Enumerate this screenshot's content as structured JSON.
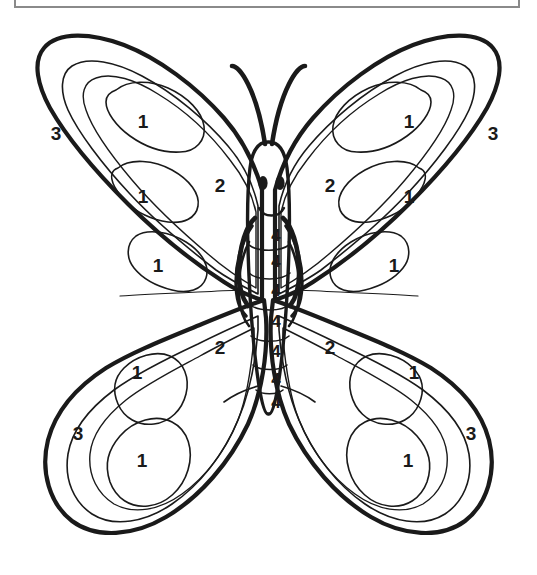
{
  "page": {
    "title_box_text": "",
    "background_color": "#ffffff",
    "ink_color": "#1a1a1a",
    "border_color": "#8a8a8a",
    "width": 537,
    "height": 575
  },
  "artwork": {
    "name": "butterfly-color-by-number",
    "description": "Color-by-number butterfly outline drawing",
    "parts": [
      "left-upper-wing",
      "right-upper-wing",
      "left-lower-wing",
      "right-lower-wing",
      "body",
      "head",
      "antennae",
      "legs"
    ]
  },
  "face": {
    "left_eye": "eye",
    "right_eye": "eye",
    "mouth": "smile"
  },
  "labels": [
    {
      "id": "lw-top-1",
      "value": "1",
      "x": 143,
      "y": 121,
      "region": "left-upper-wing-spot-1"
    },
    {
      "id": "lw-mid-1",
      "value": "1",
      "x": 143,
      "y": 196,
      "region": "left-upper-wing-spot-2"
    },
    {
      "id": "lw-bot-1",
      "value": "1",
      "x": 158,
      "y": 265,
      "region": "left-upper-wing-spot-3"
    },
    {
      "id": "rw-top-1",
      "value": "1",
      "x": 409,
      "y": 121,
      "region": "right-upper-wing-spot-1"
    },
    {
      "id": "rw-mid-1",
      "value": "1",
      "x": 409,
      "y": 196,
      "region": "right-upper-wing-spot-2"
    },
    {
      "id": "rw-bot-1",
      "value": "1",
      "x": 394,
      "y": 265,
      "region": "right-upper-wing-spot-3"
    },
    {
      "id": "llw-top-1",
      "value": "1",
      "x": 137,
      "y": 372,
      "region": "left-lower-wing-spot-1"
    },
    {
      "id": "llw-bot-1",
      "value": "1",
      "x": 142,
      "y": 460,
      "region": "left-lower-wing-spot-2"
    },
    {
      "id": "rlw-top-1",
      "value": "1",
      "x": 414,
      "y": 372,
      "region": "right-lower-wing-spot-1"
    },
    {
      "id": "rlw-bot-1",
      "value": "1",
      "x": 408,
      "y": 460,
      "region": "right-lower-wing-spot-2"
    },
    {
      "id": "lw-inner-2",
      "value": "2",
      "x": 220,
      "y": 185,
      "region": "left-upper-wing-inner"
    },
    {
      "id": "rw-inner-2",
      "value": "2",
      "x": 330,
      "y": 185,
      "region": "right-upper-wing-inner"
    },
    {
      "id": "llw-inner-2",
      "value": "2",
      "x": 220,
      "y": 347,
      "region": "left-lower-wing-inner"
    },
    {
      "id": "rlw-inner-2",
      "value": "2",
      "x": 330,
      "y": 347,
      "region": "right-lower-wing-inner"
    },
    {
      "id": "lw-edge-3",
      "value": "3",
      "x": 56,
      "y": 133,
      "region": "left-upper-wing-border"
    },
    {
      "id": "rw-edge-3",
      "value": "3",
      "x": 493,
      "y": 133,
      "region": "right-upper-wing-border"
    },
    {
      "id": "llw-edge-3",
      "value": "3",
      "x": 78,
      "y": 433,
      "region": "left-lower-wing-border"
    },
    {
      "id": "rlw-edge-3",
      "value": "3",
      "x": 471,
      "y": 433,
      "region": "right-lower-wing-border"
    },
    {
      "id": "body-seg-1",
      "value": "4",
      "x": 276,
      "y": 235,
      "region": "body-segment-1"
    },
    {
      "id": "body-seg-2",
      "value": "4",
      "x": 276,
      "y": 261,
      "region": "body-segment-2"
    },
    {
      "id": "body-seg-3",
      "value": "4",
      "x": 276,
      "y": 290,
      "region": "body-segment-3"
    },
    {
      "id": "body-seg-4",
      "value": "4",
      "x": 276,
      "y": 321,
      "region": "body-segment-4"
    },
    {
      "id": "body-seg-5",
      "value": "4",
      "x": 276,
      "y": 351,
      "region": "body-segment-5"
    },
    {
      "id": "body-seg-6",
      "value": "4",
      "x": 276,
      "y": 379,
      "region": "body-segment-6"
    },
    {
      "id": "body-seg-7",
      "value": "4",
      "x": 276,
      "y": 402,
      "region": "body-segment-7"
    }
  ]
}
